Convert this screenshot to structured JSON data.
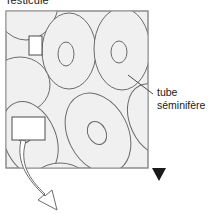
{
  "figure": {
    "title": "Testicule",
    "background_color": "#ffffff"
  },
  "frame": {
    "name": "testicle-section-frame",
    "x": 6,
    "y": 11,
    "width": 142,
    "height": 157,
    "fill_color": "#f0f0f0",
    "stroke_color": "#8c8c8c"
  },
  "labels": {
    "tube_line1": "tube",
    "tube_line2": "séminifère"
  },
  "markers": {
    "triangle_name": "black-down-triangle-marker",
    "triangle_color": "#1a1a1a"
  },
  "callouts": {
    "small_box_name": "small-magnification-box",
    "large_box_name": "large-magnification-box",
    "box_fill": "#ffffff",
    "box_stroke": "#4d4d4d"
  },
  "arrow": {
    "name": "zoom-callout-arrow",
    "stroke_color": "#6b6b6b",
    "fill_color": "#ffffff"
  },
  "tubules": {
    "stroke_color": "#6b6b6b",
    "fill_color": "#f0f0f0",
    "count": 7,
    "description": "cross-sections of seminiferous tubules with central lumen"
  }
}
